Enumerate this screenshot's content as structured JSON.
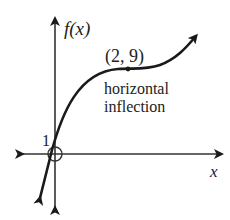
{
  "diagram": {
    "type": "function-graph",
    "y_axis_label": "f(x)",
    "x_axis_label": "x",
    "y_intercept_label": "1",
    "point_label": "(2, 9)",
    "annotation_line1": "horizontal",
    "annotation_line2": "inflection",
    "colors": {
      "ink": "#1a1a1a",
      "axis": "#333333"
    },
    "features": {
      "y_intercept": {
        "x": 0,
        "y": 1
      },
      "horizontal_inflection_point": {
        "x": 2,
        "y": 9
      },
      "origin_marker": "circle"
    }
  }
}
